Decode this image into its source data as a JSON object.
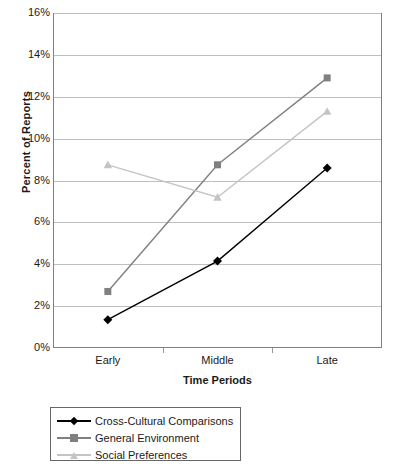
{
  "chart_data": {
    "type": "line",
    "title": "",
    "xlabel": "Time Periods",
    "ylabel": "Percent of Reports",
    "categories": [
      "Early",
      "Middle",
      "Late"
    ],
    "ylim": [
      0,
      16
    ],
    "ytick_labels": [
      "0%",
      "2%",
      "4%",
      "6%",
      "8%",
      "10%",
      "12%",
      "14%",
      "16%"
    ],
    "ytick_values": [
      0,
      2,
      4,
      6,
      8,
      10,
      12,
      14,
      16
    ],
    "grid": true,
    "legend_position": "bottom",
    "series": [
      {
        "name": "Cross-Cultural Comparisons",
        "values": [
          1.35,
          4.15,
          8.6
        ],
        "color": "#000000",
        "marker": "diamond"
      },
      {
        "name": "General Environment",
        "values": [
          2.7,
          8.75,
          12.9
        ],
        "color": "#808080",
        "marker": "square"
      },
      {
        "name": "Social Preferences",
        "values": [
          8.75,
          7.2,
          11.3
        ],
        "color": "#c4c4c4",
        "marker": "triangle"
      }
    ]
  },
  "colors": {
    "axis": "#808080",
    "grid": "#bfbfbf",
    "legend_border": "#666666",
    "text": "#1a1a1a"
  }
}
